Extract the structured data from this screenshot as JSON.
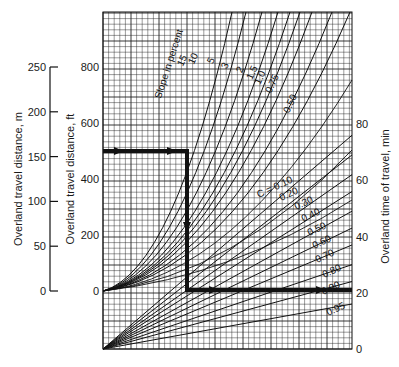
{
  "chart_data": {
    "type": "line",
    "title": "",
    "axes": {
      "left_outer": {
        "label": "Overland travel distance, m",
        "ticks": [
          0,
          50,
          100,
          150,
          200,
          250
        ],
        "range": [
          0,
          250
        ]
      },
      "left_inner": {
        "label": "Overland travel distance, ft",
        "ticks": [
          0,
          200,
          400,
          600,
          800
        ],
        "range": [
          0,
          800
        ]
      },
      "right": {
        "label": "Overland time of travel, min",
        "ticks": [
          0,
          20,
          40,
          60,
          80
        ],
        "range": [
          0,
          80
        ]
      }
    },
    "grid": true,
    "slope_curves": {
      "label": "Slope in percent",
      "series": [
        {
          "name": "15",
          "label": "15"
        },
        {
          "name": "10",
          "label": "10"
        },
        {
          "name": "5",
          "label": "5"
        },
        {
          "name": "3",
          "label": "3"
        },
        {
          "name": "2",
          "label": "2"
        },
        {
          "name": "1.5",
          "label": "1.5"
        },
        {
          "name": "1.0",
          "label": "1.0"
        },
        {
          "name": "0.75",
          "label": "0.75"
        },
        {
          "name": "0.50",
          "label": "0.50"
        }
      ]
    },
    "c_lines": {
      "label_prefix": "C = ",
      "series": [
        {
          "name": "0.10",
          "label": "0.10",
          "end_time_min": 76
        },
        {
          "name": "0.20",
          "label": "0.20",
          "end_time_min": 69
        },
        {
          "name": "0.30",
          "label": "0.30",
          "end_time_min": 62
        },
        {
          "name": "0.40",
          "label": "0.40",
          "end_time_min": 56
        },
        {
          "name": "0.50",
          "label": "0.50",
          "end_time_min": 49
        },
        {
          "name": "0.60",
          "label": "0.60",
          "end_time_min": 43
        },
        {
          "name": "0.70",
          "label": "0.70",
          "end_time_min": 37
        },
        {
          "name": "0.80",
          "label": "0.80",
          "end_time_min": 30
        },
        {
          "name": "0.90",
          "label": "0.90",
          "end_time_min": 24
        },
        {
          "name": "0.95",
          "label": "0.95",
          "end_time_min": 16
        }
      ]
    },
    "example_path": {
      "description": "Worked example: 500 ft distance, read across to slope curve, down to C line, across to time",
      "distance_ft": 500,
      "time_min": 21
    }
  }
}
